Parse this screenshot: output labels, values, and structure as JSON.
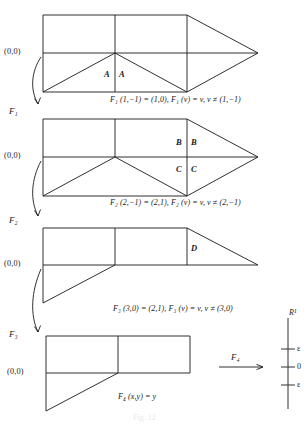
{
  "figure": {
    "caption": "Fig. 12",
    "panels": [
      {
        "id": "panel-1",
        "origin_label": "(0,0)",
        "equation": "F₁ (1,−1) = (1,0), F₁ (v) = v, v ≠ (1,−1)",
        "map_label": "F₁",
        "vertex_labels": [
          "A",
          "A"
        ]
      },
      {
        "id": "panel-2",
        "origin_label": "(0,0)",
        "equation": "F₂ (2,−1) = (2,1), F₂ (v) = v, v ≠ (2,−1)",
        "map_label": "F₂",
        "vertex_labels": [
          "B",
          "B",
          "C",
          "C"
        ]
      },
      {
        "id": "panel-3",
        "origin_label": "(0,0)",
        "equation": "F₃ (3,0) = (2,1), F₃ (v) = v, v ≠ (3,0)",
        "map_label": "F₃",
        "vertex_labels": [
          "D"
        ]
      },
      {
        "id": "panel-4",
        "origin_label": "(0,0)",
        "equation": "F₄ (x,y) = y",
        "map_label": "F₄",
        "vertex_labels": []
      }
    ],
    "axis": {
      "name": "R¹",
      "arrow_label": "F₄",
      "ticks": [
        {
          "label": "ε"
        },
        {
          "label": "0"
        },
        {
          "label": "ε"
        }
      ]
    },
    "colors": {
      "stroke": "#1a1a1a",
      "background": "#ffffff",
      "text": "#1a1a1a"
    }
  }
}
